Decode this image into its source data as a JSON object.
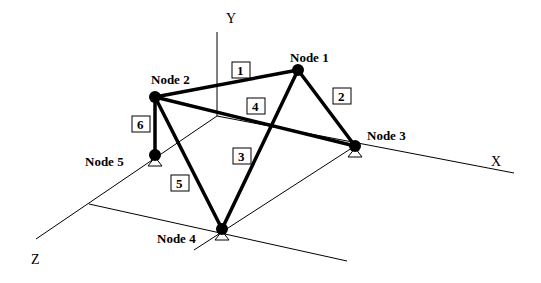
{
  "axes": {
    "x_label": "X",
    "y_label": "Y",
    "z_label": "Z"
  },
  "nodes": [
    {
      "id": 1,
      "label": "Node 1",
      "x": 298,
      "y": 70,
      "support": false
    },
    {
      "id": 2,
      "label": "Node 2",
      "x": 155,
      "y": 97,
      "support": false
    },
    {
      "id": 3,
      "label": "Node 3",
      "x": 355,
      "y": 146,
      "support": true
    },
    {
      "id": 4,
      "label": "Node 4",
      "x": 222,
      "y": 229,
      "support": true
    },
    {
      "id": 5,
      "label": "Node 5",
      "x": 155,
      "y": 155,
      "support": true
    }
  ],
  "members": [
    {
      "id": "1",
      "label": "1",
      "from": 2,
      "to": 1
    },
    {
      "id": "2",
      "label": "2",
      "from": 1,
      "to": 3
    },
    {
      "id": "3",
      "label": "3",
      "from": 1,
      "to": 4
    },
    {
      "id": "4",
      "label": "4",
      "from": 2,
      "to": 3
    },
    {
      "id": "5",
      "label": "5",
      "from": 2,
      "to": 4
    },
    {
      "id": "6",
      "label": "6",
      "from": 2,
      "to": 5
    }
  ],
  "colors": {
    "line": "#000000",
    "background": "#ffffff"
  }
}
